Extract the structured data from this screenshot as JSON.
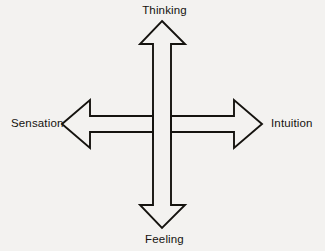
{
  "diagram": {
    "background_color": "#f3f2f0",
    "stroke_color": "#15130f",
    "fill_color": "#f3f2f0",
    "labels": {
      "top": "Thinking",
      "bottom": "Feeling",
      "left": "Sensation",
      "right": "Intuition"
    },
    "axes": [
      {
        "name": "vertical-axis",
        "from": "Feeling",
        "to": "Thinking",
        "orientation": "vertical",
        "double_headed": true
      },
      {
        "name": "horizontal-axis",
        "from": "Sensation",
        "to": "Intuition",
        "orientation": "horizontal",
        "double_headed": true
      }
    ],
    "geometry": {
      "center_x": 162,
      "center_y": 124,
      "vertical_shaft_left": 153,
      "vertical_shaft_right": 171,
      "vertical_tip_top": 21,
      "vertical_tip_bottom": 228,
      "vertical_head_base_top": 44,
      "vertical_head_base_bottom": 205,
      "vertical_head_wing_left": 140,
      "vertical_head_wing_right": 185,
      "horizontal_shaft_top": 116,
      "horizontal_shaft_bottom": 132,
      "horizontal_tip_left": 62,
      "horizontal_tip_right": 262,
      "horizontal_head_base_left": 90,
      "horizontal_head_base_right": 234,
      "horizontal_head_wing_top": 100,
      "horizontal_head_wing_bottom": 148
    }
  }
}
